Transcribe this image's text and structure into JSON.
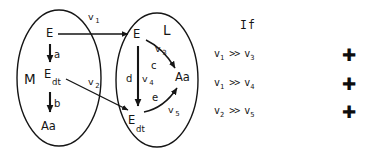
{
  "diagram": {
    "ink_color": "#151515",
    "background": "#ffffff",
    "compartments": [
      {
        "id": "M",
        "label": "M",
        "nodes": [
          {
            "id": "M-E",
            "base": "E",
            "sub": ""
          },
          {
            "id": "M-Edt",
            "base": "E",
            "sub": "dt"
          },
          {
            "id": "M-Aa",
            "base": "Aa",
            "sub": ""
          }
        ],
        "transitions": [
          {
            "from": "M-E",
            "to": "M-Edt",
            "label": "a"
          },
          {
            "from": "M-Edt",
            "to": "M-Aa",
            "label": "b"
          }
        ]
      },
      {
        "id": "L",
        "label": "L",
        "nodes": [
          {
            "id": "L-E",
            "base": "E",
            "sub": ""
          },
          {
            "id": "L-Edt",
            "base": "E",
            "sub": "dt"
          },
          {
            "id": "L-Aa",
            "base": "Aa",
            "sub": ""
          }
        ],
        "transitions": [
          {
            "from": "L-E",
            "to": "L-Edt",
            "label": "d",
            "flux": "v",
            "flux_sub": "4"
          },
          {
            "from": "L-E",
            "to": "L-Aa",
            "label": "c",
            "flux": "v",
            "flux_sub": "3"
          },
          {
            "from": "L-Edt",
            "to": "L-Aa",
            "label": "e",
            "flux": "v",
            "flux_sub": "5"
          }
        ]
      }
    ],
    "cross_fluxes": [
      {
        "from": "M-E",
        "to": "L-E",
        "flux": "v",
        "flux_sub": "1"
      },
      {
        "from": "M-Edt",
        "to": "L-Edt",
        "flux": "v",
        "flux_sub": "2"
      }
    ],
    "labels": {
      "set_M": "M",
      "set_L": "L",
      "node_E": "E",
      "node_Aa": "Aa",
      "sub_dt": "dt",
      "rate_a": "a",
      "rate_b": "b",
      "rate_c": "c",
      "rate_d": "d",
      "rate_e": "e",
      "flux_v": "v",
      "flux_1": "1",
      "flux_2": "2",
      "flux_3": "3",
      "flux_4": "4",
      "flux_5": "5"
    }
  },
  "conditions": {
    "header": "If",
    "rows": [
      {
        "left": "v",
        "left_sub": "1",
        "operator": ">>",
        "right": "v",
        "right_sub": "3",
        "marker": "✚"
      },
      {
        "left": "v",
        "left_sub": "1",
        "operator": ">>",
        "right": "v",
        "right_sub": "4",
        "marker": "✚"
      },
      {
        "left": "v",
        "left_sub": "2",
        "operator": ">>",
        "right": "v",
        "right_sub": "5",
        "marker": "✚"
      }
    ]
  }
}
